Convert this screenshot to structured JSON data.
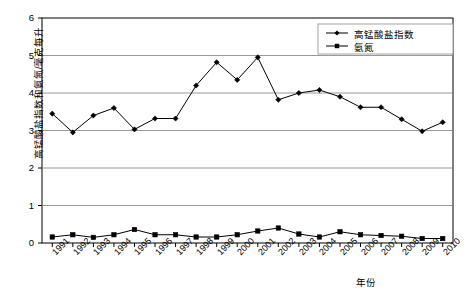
{
  "chart_data": {
    "type": "line",
    "title": "",
    "xlabel": "年份",
    "ylabel": "高锰酸盐指数和氨氮/毫克每升",
    "xlim": [
      1991,
      2010
    ],
    "ylim": [
      0,
      6
    ],
    "yticks": [
      "0",
      "1",
      "2",
      "3",
      "4",
      "5",
      "6"
    ],
    "grid": true,
    "legend_position": "top-right",
    "categories": [
      "1991",
      "1992",
      "1993",
      "1994",
      "1995",
      "1996",
      "1997",
      "1998",
      "1999",
      "2000",
      "2001",
      "2002",
      "2003",
      "2004",
      "2005",
      "2006",
      "2007",
      "2008",
      "2009",
      "2010"
    ],
    "series": [
      {
        "name": "高锰酸盐指数",
        "marker": "diamond",
        "color": "#000000",
        "values": [
          3.45,
          2.95,
          3.4,
          3.6,
          3.03,
          3.32,
          3.32,
          4.2,
          4.82,
          4.35,
          4.95,
          3.82,
          4.0,
          4.08,
          3.9,
          3.62,
          3.62,
          3.3,
          2.98,
          3.22
        ]
      },
      {
        "name": "氨氮",
        "marker": "square",
        "color": "#000000",
        "values": [
          0.16,
          0.22,
          0.15,
          0.22,
          0.36,
          0.22,
          0.22,
          0.16,
          0.16,
          0.22,
          0.32,
          0.4,
          0.24,
          0.16,
          0.3,
          0.22,
          0.2,
          0.18,
          0.12,
          0.12
        ]
      }
    ]
  },
  "legend": {
    "items": [
      {
        "label": "高锰酸盐指数"
      },
      {
        "label": "氨氮"
      }
    ]
  }
}
